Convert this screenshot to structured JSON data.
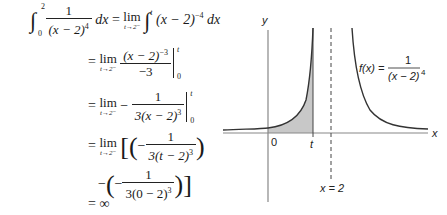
{
  "derivation": {
    "lhs": {
      "integral_upper": "2",
      "integral_lower": "0",
      "integrand_num": "1",
      "integrand_den": "(x − 2)",
      "integrand_den_exp": "4",
      "dx": "dx"
    },
    "step1": {
      "eq": "=",
      "lim": "lim",
      "lim_sub": "t→2⁻",
      "upper": "t",
      "lower": "0",
      "expr": "(x − 2)",
      "exp": "−4",
      "dx": "dx"
    },
    "step2": {
      "eq": "=",
      "lim": "lim",
      "lim_sub": "t→2⁻",
      "num": "(x − 2)",
      "num_exp": "−3",
      "den": "−3",
      "upper": "t",
      "lower": "0"
    },
    "step3": {
      "eq": "=",
      "lim": "lim",
      "lim_sub": "t→2⁻",
      "sign": "−",
      "num": "1",
      "den": "3(x − 2)",
      "den_exp": "3",
      "upper": "t",
      "lower": "0"
    },
    "step4": {
      "eq": "=",
      "lim": "lim",
      "lim_sub": "t→2⁻",
      "num": "1",
      "den": "3(t − 2)",
      "den_exp": "3"
    },
    "step5": {
      "num": "1",
      "den": "3(0 − 2)",
      "den_exp": "3"
    },
    "result": {
      "eq": "=",
      "value": "∞"
    }
  },
  "graph": {
    "y_label": "y",
    "x_label": "x",
    "origin_label": "0",
    "t_label": "t",
    "asymptote_label": "x = 2",
    "function_label_lhs": "f(x) =",
    "function_num": "1",
    "function_den": "(x − 2)",
    "function_den_exp": "4",
    "shade_color": "#c8c8c8",
    "curve_color": "#333333"
  }
}
